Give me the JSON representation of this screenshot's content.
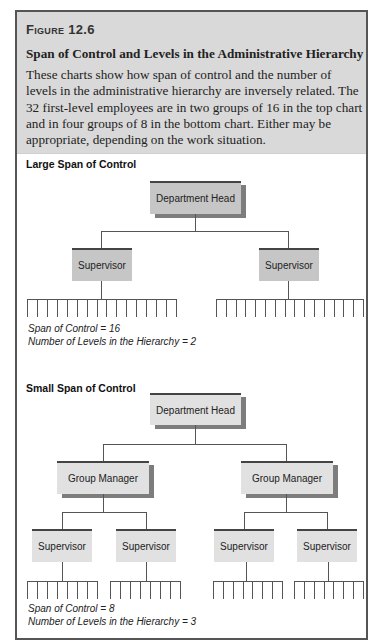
{
  "figure": {
    "label": "Figure 12.6",
    "title": "Span of Control and Levels in the Administrative Hierarchy",
    "description": "These charts show how span of control and the number of levels in the administrative hierarchy are inversely related. The 32 first-level employees are in two groups of 16 in the top chart and in four groups of 8 in the bottom chart. Either may be appropriate, depending on the work situation."
  },
  "top_chart": {
    "title": "Large Span of Control",
    "root": "Department Head",
    "level2": [
      "Supervisor",
      "Supervisor"
    ],
    "employees_per_supervisor": 16,
    "notes": [
      "Span of Control = 16",
      "Number of Levels in the Hierarchy = 2"
    ]
  },
  "bottom_chart": {
    "title": "Small Span of Control",
    "root": "Department Head",
    "level2": [
      "Group Manager",
      "Group Manager"
    ],
    "level3": [
      "Supervisor",
      "Supervisor",
      "Supervisor",
      "Supervisor"
    ],
    "employees_per_supervisor": 8,
    "notes": [
      "Span of Control = 8",
      "Number of Levels in the Hierarchy = 3"
    ]
  },
  "colors": {
    "header_bg": "#d9d9d9",
    "top_node_fill": "#c6c6c6",
    "bottom_node_fill": "#e1e1e1",
    "shadow": "#7d7d7d",
    "frame_border": "#555555"
  }
}
